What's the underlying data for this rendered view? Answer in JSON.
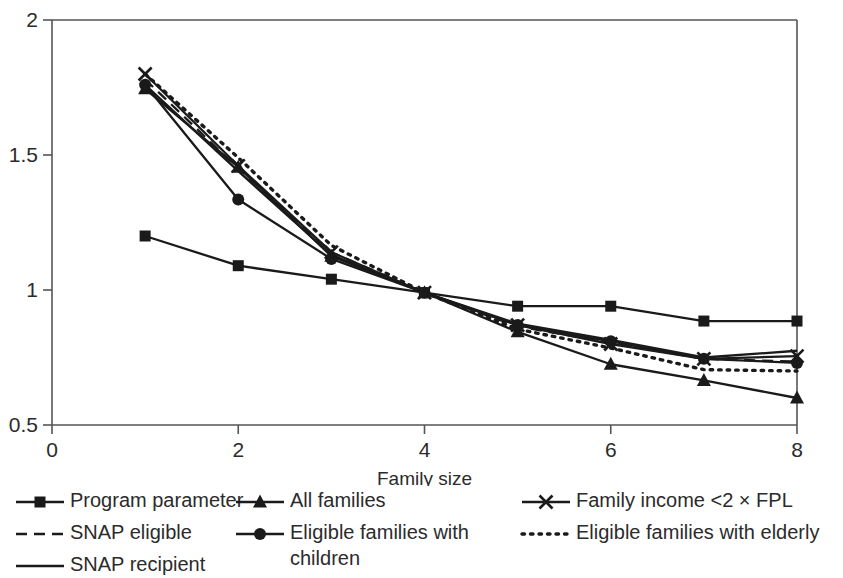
{
  "chart_data": {
    "type": "line",
    "title": "",
    "subtitle": "",
    "xlabel": "Family size",
    "ylabel": "",
    "x": [
      1,
      2,
      3,
      4,
      5,
      6,
      7,
      8
    ],
    "xlim": [
      0,
      8
    ],
    "ylim": [
      0.5,
      2
    ],
    "x_ticks": [
      "0",
      "2",
      "4",
      "6",
      "8"
    ],
    "x_tick_values": [
      0,
      2,
      4,
      6,
      8
    ],
    "y_ticks": [
      "0.5",
      "1",
      "1.5",
      "2"
    ],
    "y_tick_values": [
      0.5,
      1,
      1.5,
      2
    ],
    "grid": false,
    "legend_position": "below",
    "series": [
      {
        "name": "Program parameter",
        "marker": "square",
        "line": "solid",
        "values": [
          1.2,
          1.09,
          1.04,
          0.99,
          0.94,
          0.94,
          0.885,
          0.885
        ]
      },
      {
        "name": "SNAP eligible",
        "marker": "none",
        "line": "dashed",
        "values": [
          1.78,
          1.45,
          1.14,
          0.99,
          0.865,
          0.805,
          0.745,
          0.735
        ]
      },
      {
        "name": "SNAP recipient",
        "marker": "none",
        "line": "solid",
        "values": [
          1.76,
          1.44,
          1.13,
          0.99,
          0.875,
          0.815,
          0.75,
          0.775
        ]
      },
      {
        "name": "All families",
        "marker": "triangle",
        "line": "solid",
        "values": [
          1.745,
          1.455,
          1.125,
          0.99,
          0.845,
          0.725,
          0.665,
          0.6
        ]
      },
      {
        "name": "Eligible families with children",
        "marker": "circle",
        "line": "solid",
        "values": [
          1.76,
          1.335,
          1.115,
          0.99,
          0.87,
          0.81,
          0.745,
          0.73
        ]
      },
      {
        "name": "Family income <2 × FPL",
        "marker": "cross",
        "line": "solid",
        "values": [
          1.8,
          1.46,
          1.14,
          0.99,
          0.87,
          0.8,
          0.745,
          0.755
        ]
      },
      {
        "name": "Eligible families with elderly",
        "marker": "none",
        "line": "dotted",
        "values": [
          1.8,
          1.49,
          1.165,
          0.99,
          0.855,
          0.785,
          0.705,
          0.7
        ]
      }
    ]
  },
  "legend": {
    "columns": [
      {
        "entries": [
          {
            "label": "Program parameter",
            "key": "line-square-marker",
            "wrap": false
          },
          {
            "label": "SNAP eligible",
            "key": "line-dashed",
            "wrap": false
          },
          {
            "label": "SNAP recipient",
            "key": "line-solid",
            "wrap": false
          }
        ]
      },
      {
        "entries": [
          {
            "label": "All families",
            "key": "line-triangle-marker",
            "wrap": false
          },
          {
            "label": "Eligible families with children",
            "key": "line-circle-marker",
            "wrap": true
          }
        ]
      },
      {
        "entries": [
          {
            "label": "Family income <2 × FPL",
            "key": "line-cross-marker",
            "wrap": false
          },
          {
            "label": "Eligible families with elderly",
            "key": "line-dotted",
            "wrap": false
          }
        ]
      }
    ]
  },
  "colors": {
    "ink": "#1a1a1a",
    "axis": "#555555",
    "background": "#ffffff"
  }
}
